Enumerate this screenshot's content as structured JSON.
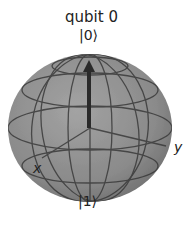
{
  "figure": {
    "title": "qubit 0",
    "labels": {
      "north": "|0⟩",
      "south": "|1⟩",
      "x_axis": "x",
      "y_axis": "y"
    },
    "colors": {
      "sphere_fill": "#8c8c8c",
      "sphere_shade": "#6e6e6e",
      "gridline": "#3a3a3a",
      "vector": "#2a2a2a",
      "text": "#222222"
    },
    "state_vector": {
      "target": "|0⟩",
      "direction": "+z"
    }
  }
}
